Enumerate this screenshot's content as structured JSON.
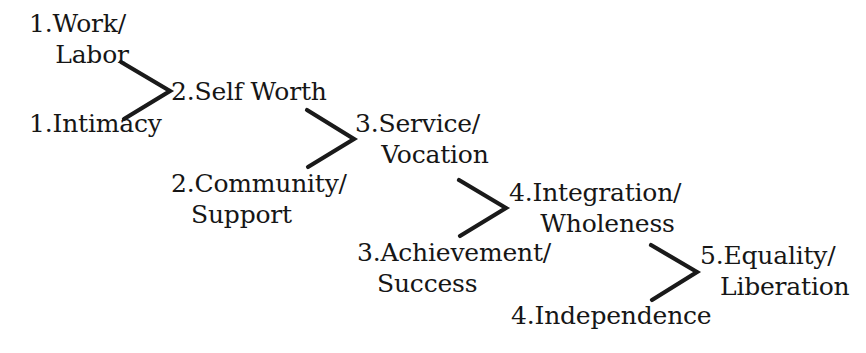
{
  "diagram": {
    "background_color": "#ffffff",
    "text_color": "#161616",
    "stroke_color": "#1a1a1a",
    "nodes": [
      {
        "id": "work-labor",
        "line_1": "1.Work/",
        "line_2": "Labor",
        "column": "input",
        "stage": 1
      },
      {
        "id": "intimacy",
        "line_1": "1.Intimacy",
        "line_2": "",
        "column": "input",
        "stage": 1
      },
      {
        "id": "self-worth",
        "line_1": "2.Self Worth",
        "line_2": "",
        "column": "output",
        "stage": 2
      },
      {
        "id": "community-support",
        "line_1": "2.Community/",
        "line_2": "Support",
        "column": "input",
        "stage": 2
      },
      {
        "id": "service-vocation",
        "line_1": "3.Service/",
        "line_2": "Vocation",
        "column": "output",
        "stage": 3
      },
      {
        "id": "achievement-success",
        "line_1": "3.Achievement/",
        "line_2": "Success",
        "column": "input",
        "stage": 3
      },
      {
        "id": "integration-wholeness",
        "line_1": "4.Integration/",
        "line_2": "Wholeness",
        "column": "output",
        "stage": 4
      },
      {
        "id": "independence",
        "line_1": "4.Independence",
        "line_2": "",
        "column": "input",
        "stage": 4
      },
      {
        "id": "equality-liberation",
        "line_1": "5.Equality/",
        "line_2": "Liberation",
        "column": "output",
        "stage": 5
      }
    ],
    "connectors": [
      {
        "id": "merge-1",
        "label": "chevron-merge-to-self-worth",
        "from": [
          "work-labor",
          "intimacy"
        ],
        "to": "self-worth"
      },
      {
        "id": "merge-2",
        "label": "chevron-merge-to-service-vocation",
        "from": [
          "self-worth",
          "community-support"
        ],
        "to": "service-vocation"
      },
      {
        "id": "merge-3",
        "label": "chevron-merge-to-integration-wholeness",
        "from": [
          "service-vocation",
          "achievement-success"
        ],
        "to": "integration-wholeness"
      },
      {
        "id": "merge-4",
        "label": "chevron-merge-to-equality-liberation",
        "from": [
          "integration-wholeness",
          "independence"
        ],
        "to": "equality-liberation"
      }
    ]
  }
}
